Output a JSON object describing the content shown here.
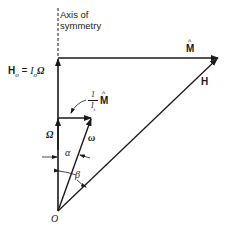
{
  "diagram": {
    "type": "vector diagram",
    "labels": {
      "axis": "Axis of\nsymmetry",
      "axis_line1": "Axis of",
      "axis_line2": "symmetry",
      "H_o_lhs": "H",
      "H_o_sub": "o",
      "H_o_eq": " = ",
      "H_o_I": "I",
      "H_o_I_sub": "o",
      "H_o_Omega": "Ω",
      "M_hat": "M",
      "H": "H",
      "frac_num": "1",
      "frac_den": "I",
      "frac_den_sub": "t",
      "frac_M": "M",
      "Omega": "Ω",
      "omega": "ω",
      "alpha": "α",
      "beta": "β",
      "origin": "O"
    },
    "colors": {
      "line": "#1a1a1a",
      "background": "#ffffff"
    },
    "geometry": {
      "origin": [
        58,
        211
      ],
      "axis_top": [
        58,
        8
      ],
      "H_o_tip": [
        58,
        58
      ],
      "M_hat_tip": [
        218,
        58
      ],
      "Omega_tip": [
        58,
        118
      ],
      "small_M_tip": [
        92,
        118
      ]
    }
  }
}
